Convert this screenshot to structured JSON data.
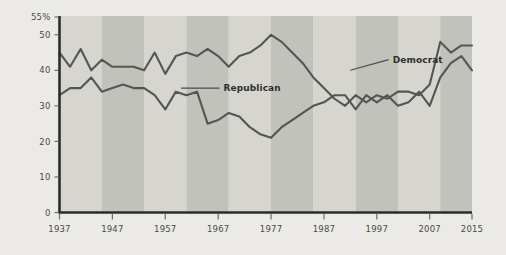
{
  "chart_data": {
    "type": "line",
    "title": "",
    "subtitle": "",
    "xlabel": "",
    "ylabel": "",
    "xlim": [
      1937,
      2015
    ],
    "ylim": [
      0,
      55
    ],
    "grid": false,
    "legend_position": "inline-annotations",
    "x_tick_labels": [
      "1937",
      "1947",
      "1957",
      "1967",
      "1977",
      "1987",
      "1997",
      "2007",
      "2015"
    ],
    "x_ticks": [
      1937,
      1947,
      1957,
      1967,
      1977,
      1987,
      1997,
      2007,
      2015
    ],
    "y_tick_labels": [
      "55%",
      "50",
      "40",
      "30",
      "20",
      "10",
      "0"
    ],
    "y_ticks": [
      55,
      50,
      40,
      30,
      20,
      10,
      0
    ],
    "colors": {
      "democrat_line": "#555552",
      "republican_line": "#555552",
      "axis": "#2b2b29",
      "band_light": "#d6d5d0",
      "band_dark": "#c2c2bd",
      "page_background": "#ebeae6",
      "label_text": "#2e2e2c",
      "tick_text": "#4a4a48"
    },
    "bands": [
      {
        "start": 1937,
        "end": 1945,
        "shade": "light"
      },
      {
        "start": 1945,
        "end": 1953,
        "shade": "dark"
      },
      {
        "start": 1953,
        "end": 1961,
        "shade": "light"
      },
      {
        "start": 1961,
        "end": 1969,
        "shade": "dark"
      },
      {
        "start": 1969,
        "end": 1977,
        "shade": "light"
      },
      {
        "start": 1977,
        "end": 1985,
        "shade": "dark"
      },
      {
        "start": 1985,
        "end": 1993,
        "shade": "light"
      },
      {
        "start": 1993,
        "end": 2001,
        "shade": "dark"
      },
      {
        "start": 2001,
        "end": 2009,
        "shade": "light"
      },
      {
        "start": 2009,
        "end": 2015,
        "shade": "dark"
      }
    ],
    "series": [
      {
        "name": "Democrat",
        "label": "Democrat",
        "label_x": 2000,
        "label_y": 43,
        "leader_from_x": 1992,
        "leader_from_y": 40,
        "x": [
          1937,
          1939,
          1941,
          1943,
          1945,
          1947,
          1949,
          1951,
          1953,
          1955,
          1957,
          1959,
          1961,
          1963,
          1965,
          1967,
          1969,
          1971,
          1973,
          1975,
          1977,
          1979,
          1981,
          1983,
          1985,
          1987,
          1989,
          1991,
          1993,
          1995,
          1997,
          1999,
          2001,
          2003,
          2005,
          2007,
          2009,
          2011,
          2013,
          2015
        ],
        "values": [
          45,
          41,
          46,
          40,
          43,
          41,
          41,
          41,
          40,
          45,
          39,
          44,
          45,
          44,
          46,
          44,
          41,
          44,
          45,
          47,
          50,
          48,
          45,
          42,
          38,
          35,
          32,
          30,
          33,
          31,
          33,
          32,
          34,
          34,
          33,
          36,
          48,
          45,
          47,
          47
        ]
      },
      {
        "name": "Republican",
        "label": "Republican",
        "label_x": 1968,
        "label_y": 35,
        "leader_from_x": 1960,
        "leader_from_y": 35,
        "x": [
          1937,
          1939,
          1941,
          1943,
          1945,
          1947,
          1949,
          1951,
          1953,
          1955,
          1957,
          1959,
          1961,
          1963,
          1965,
          1967,
          1969,
          1971,
          1973,
          1975,
          1977,
          1979,
          1981,
          1983,
          1985,
          1987,
          1989,
          1991,
          1993,
          1995,
          1997,
          1999,
          2001,
          2003,
          2005,
          2007,
          2009,
          2011,
          2013,
          2015
        ],
        "values": [
          33,
          35,
          35,
          38,
          34,
          35,
          36,
          35,
          35,
          33,
          29,
          34,
          33,
          34,
          25,
          26,
          28,
          27,
          24,
          22,
          21,
          24,
          26,
          28,
          30,
          31,
          33,
          33,
          29,
          33,
          31,
          33,
          30,
          31,
          34,
          30,
          38,
          42,
          44,
          40
        ]
      }
    ]
  }
}
